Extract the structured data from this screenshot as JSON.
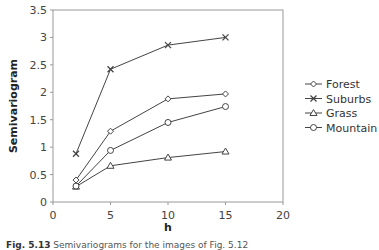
{
  "chart_data": {
    "type": "line",
    "title": "",
    "xlabel": "h",
    "ylabel": "Semivariogram",
    "xlim": [
      0,
      20
    ],
    "ylim": [
      0,
      3.5
    ],
    "xticks": [
      0,
      5,
      10,
      15,
      20
    ],
    "yticks": [
      0,
      0.5,
      1,
      1.5,
      2,
      2.5,
      3,
      3.5
    ],
    "ytick_labels": [
      "0",
      "0.5",
      "1",
      "1.5",
      "2",
      "2.5",
      "3",
      "3.5"
    ],
    "xtick_labels": [
      "0",
      "5",
      "10",
      "15",
      "20"
    ],
    "grid": false,
    "legend_position": "right",
    "x": [
      2,
      5,
      10,
      15
    ],
    "series": [
      {
        "name": "Forest",
        "marker": "diamond",
        "values": [
          0.4,
          1.29,
          1.88,
          1.97
        ]
      },
      {
        "name": "Suburbs",
        "marker": "x",
        "values": [
          0.88,
          2.42,
          2.86,
          3.0
        ]
      },
      {
        "name": "Grass",
        "marker": "triangle",
        "values": [
          0.28,
          0.66,
          0.81,
          0.92
        ]
      },
      {
        "name": "Mountain",
        "marker": "circle",
        "values": [
          0.29,
          0.94,
          1.45,
          1.74
        ]
      }
    ]
  },
  "caption": {
    "label": "Fig. 5.13",
    "text": "Semivariograms for the images of Fig. 5.12"
  },
  "colors": {
    "line": "#444444",
    "axis": "#999999"
  }
}
